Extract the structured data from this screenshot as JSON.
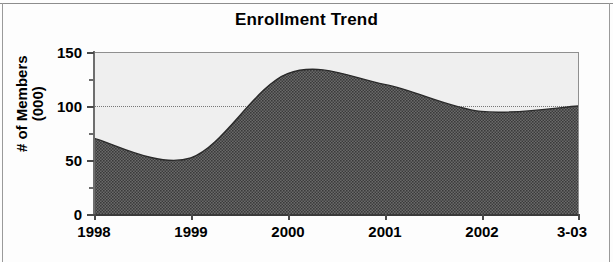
{
  "chart_data": {
    "type": "area",
    "title": "Enrollment Trend",
    "xlabel": "",
    "ylabel": "# of Members\n(000)",
    "categories": [
      "1998",
      "1999",
      "2000",
      "2001",
      "2002",
      "3-03"
    ],
    "values": [
      70,
      52,
      130,
      120,
      95,
      100
    ],
    "series": [
      {
        "name": "# of Members (000)",
        "values": [
          70,
          52,
          130,
          120,
          95,
          100
        ]
      }
    ],
    "ylim": [
      0,
      150
    ],
    "yticks": [
      0,
      50,
      100,
      150
    ],
    "ytick_labels": [
      "0",
      "50",
      "100",
      "150"
    ],
    "yminor_ticks": [
      25,
      75,
      125
    ],
    "gridlines": [
      100
    ],
    "grid": "dotted-horizontal-at-100",
    "legend": "none",
    "smoothing": "spline",
    "colors": {
      "area_fill": "#595959",
      "plot_background": "#efefef",
      "axis": "#3a3a3a",
      "text": "#000000",
      "gridline": "#777777"
    }
  },
  "chart": {
    "title": "Enrollment Trend",
    "y_axis_title_line1": "# of Members",
    "y_axis_title_line2": "(000)",
    "y_axis_title": "# of Members\n(000)",
    "y_labels": [
      "150",
      "100",
      "50",
      "0"
    ],
    "x_labels": [
      "1998",
      "1999",
      "2000",
      "2001",
      "2002",
      "3-03"
    ]
  }
}
